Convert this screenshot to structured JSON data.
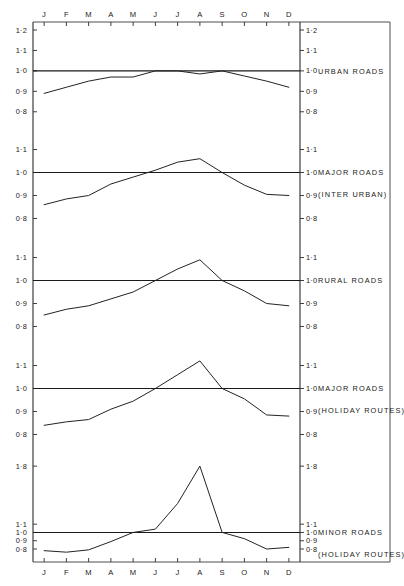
{
  "chart_data": {
    "type": "line",
    "title": "",
    "xlabel": "",
    "ylabel": "",
    "grid": false,
    "legend_position": "right",
    "categories": [
      "J",
      "F",
      "M",
      "A",
      "M",
      "J",
      "J",
      "A",
      "S",
      "O",
      "N",
      "D"
    ],
    "month_labels_top": [
      "J",
      "F",
      "M",
      "A",
      "M",
      "J",
      "J",
      "A",
      "S",
      "O",
      "N",
      "D"
    ],
    "month_labels_bottom": [
      "J",
      "F",
      "M",
      "A",
      "M",
      "J",
      "J",
      "A",
      "S",
      "O",
      "N",
      "D"
    ],
    "baseline_value": "1.0",
    "panels": [
      {
        "name": "urban-roads",
        "label_lines": [
          "URBAN ROADS"
        ],
        "ytick_labels": [
          "1·2",
          "1·1",
          "1·0",
          "0·9",
          "0·8"
        ],
        "ytick_values": [
          1.2,
          1.1,
          1.0,
          0.9,
          0.8
        ],
        "ylim": [
          0.75,
          1.2
        ],
        "values": [
          0.89,
          0.92,
          0.95,
          0.97,
          0.97,
          1.0,
          1.0,
          0.985,
          1.0,
          0.975,
          0.95,
          0.92
        ]
      },
      {
        "name": "major-roads-inter-urban",
        "label_lines": [
          "MAJOR ROADS",
          "(INTER URBAN)"
        ],
        "ytick_labels": [
          "1·1",
          "1·0",
          "0·9",
          "0·8"
        ],
        "ytick_values": [
          1.1,
          1.0,
          0.9,
          0.8
        ],
        "ylim": [
          0.75,
          1.15
        ],
        "values": [
          0.86,
          0.885,
          0.9,
          0.95,
          0.98,
          1.01,
          1.045,
          1.06,
          1.0,
          0.945,
          0.905,
          0.9
        ]
      },
      {
        "name": "rural-roads",
        "label_lines": [
          "RURAL ROADS"
        ],
        "ytick_labels": [
          "1·1",
          "1·0",
          "0·9",
          "0·8"
        ],
        "ytick_values": [
          1.1,
          1.0,
          0.9,
          0.8
        ],
        "ylim": [
          0.75,
          1.15
        ],
        "values": [
          0.85,
          0.875,
          0.89,
          0.92,
          0.95,
          1.0,
          1.05,
          1.09,
          1.0,
          0.955,
          0.9,
          0.89
        ]
      },
      {
        "name": "major-roads-holiday-routes",
        "label_lines": [
          "MAJOR ROADS",
          "(HOLIDAY ROUTES)"
        ],
        "ytick_labels": [
          "1·1",
          "1·0",
          "0·9",
          "0·8"
        ],
        "ytick_values": [
          1.1,
          1.0,
          0.9,
          0.8
        ],
        "ylim": [
          0.75,
          1.15
        ],
        "values": [
          0.84,
          0.855,
          0.865,
          0.91,
          0.945,
          1.0,
          1.06,
          1.12,
          1.0,
          0.955,
          0.885,
          0.88
        ]
      },
      {
        "name": "minor-roads-holiday-routes",
        "label_lines": [
          "MINOR ROADS",
          "(HOLIDAY ROUTES)"
        ],
        "ytick_labels": [
          "1·8",
          "1·1",
          "1·0",
          "0·9",
          "0·8"
        ],
        "ytick_values": [
          1.8,
          1.1,
          1.0,
          0.9,
          0.8
        ],
        "ylim": [
          0.74,
          1.85
        ],
        "values": [
          0.78,
          0.762,
          0.79,
          0.89,
          1.0,
          1.04,
          1.35,
          1.8,
          1.0,
          0.925,
          0.8,
          0.82
        ]
      }
    ]
  }
}
